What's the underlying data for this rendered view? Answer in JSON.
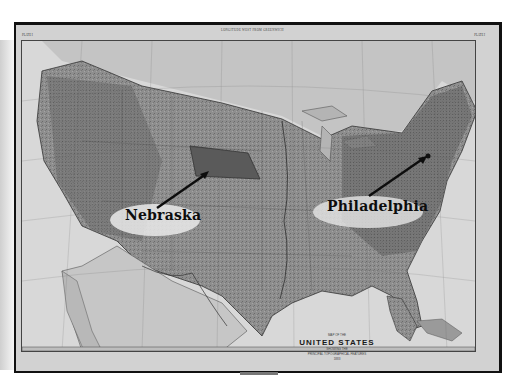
{
  "map": {
    "title_small_top": "MAP OF THE",
    "title_main": "UNITED STATES",
    "title_sub1": "SHOWING THE",
    "title_sub2": "PRINCIPAL TOPOGRAPHICAL FEATURES",
    "title_year": "1883",
    "top_caption": "LONGITUDE WEST FROM GREENWICH",
    "plate_left": "PLATE I",
    "plate_right": "PLATE I",
    "style": "grayscale historical engraving",
    "colors": {
      "paper": "#d2d2d2",
      "land": "#8a8a8a",
      "ocean": "#dedede",
      "highlight": "#5e5e5e",
      "frame": "#111111",
      "annotation": "#0d0d0d"
    }
  },
  "annotations": [
    {
      "id": "nebraska",
      "label": "Nebraska",
      "arrow_from": [
        160,
        205
      ],
      "arrow_to": [
        210,
        170
      ]
    },
    {
      "id": "philadelphia",
      "label": "Philadelphia",
      "arrow_from": [
        372,
        193
      ],
      "arrow_to": [
        430,
        152
      ]
    }
  ]
}
